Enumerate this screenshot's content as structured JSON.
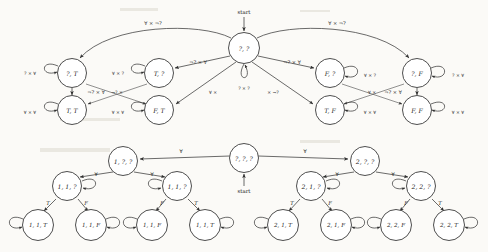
{
  "figure": {
    "kind": "two finite-state automata diagrams",
    "background_color": "#fbfaf7",
    "ink_color": "#3a3a3a"
  },
  "symbols": {
    "forall": "∀",
    "times": "×",
    "neg": "¬",
    "question": "?"
  },
  "top_automaton": {
    "name": "pair-state automaton",
    "start_label": "start",
    "start_state": "?, ?",
    "states": [
      {
        "id": "qq",
        "label": "?, ?",
        "cx": 244,
        "cy": 48,
        "r": 15.5
      },
      {
        "id": "qT",
        "label": "?, T",
        "cx": 72,
        "cy": 73,
        "r": 14.5
      },
      {
        "id": "Tq",
        "label": "T, ?",
        "cx": 159,
        "cy": 73,
        "r": 14.5
      },
      {
        "id": "Fq",
        "label": "F, ?",
        "cx": 330,
        "cy": 73,
        "r": 14.5
      },
      {
        "id": "qF",
        "label": "?, F",
        "cx": 417,
        "cy": 73,
        "r": 14.5
      },
      {
        "id": "TT",
        "label": "T, T",
        "cx": 72,
        "cy": 110,
        "r": 14.5
      },
      {
        "id": "FT",
        "label": "F, T",
        "cx": 159,
        "cy": 110,
        "r": 14.5
      },
      {
        "id": "TF",
        "label": "T, F",
        "cx": 330,
        "cy": 110,
        "r": 14.5
      },
      {
        "id": "FF",
        "label": "F, F",
        "cx": 417,
        "cy": 110,
        "r": 14.5
      }
    ],
    "self_loops": [
      {
        "state": "qq",
        "label": "? × ?",
        "x": 244,
        "y": 88,
        "side": "bottom"
      },
      {
        "state": "qT",
        "label": "? × ∀",
        "x": 36,
        "y": 73,
        "side": "left"
      },
      {
        "state": "Tq",
        "label": "∀ × ?",
        "x": 123,
        "y": 73,
        "side": "left"
      },
      {
        "state": "Fq",
        "label": "∀ × ?",
        "x": 366,
        "y": 75,
        "side": "right"
      },
      {
        "state": "qF",
        "label": "? × ∀",
        "x": 453,
        "y": 75,
        "side": "right"
      },
      {
        "state": "TT",
        "label": "∀ × ∀",
        "x": 36,
        "y": 112,
        "side": "left"
      },
      {
        "state": "FT",
        "label": "∀ × ∀",
        "x": 123,
        "y": 112,
        "side": "left"
      },
      {
        "state": "TF",
        "label": "∀ × ∀",
        "x": 366,
        "y": 112,
        "side": "right"
      },
      {
        "state": "FF",
        "label": "∀ × ∀",
        "x": 453,
        "y": 112,
        "side": "right"
      }
    ],
    "arc_labels": [
      {
        "label": "∀ × ¬?",
        "x": 153,
        "y": 23
      },
      {
        "label": "∀ × ¬?",
        "x": 337,
        "y": 23
      }
    ],
    "vertical_labels": [
      {
        "label": "¬? × ∀",
        "x": 96,
        "y": 92
      },
      {
        "label": "¬? × ∀",
        "x": 393,
        "y": 92
      }
    ],
    "diagonal_labels": [
      {
        "label": "¬? × ∀",
        "x": 198,
        "y": 62
      },
      {
        "label": "¬? × ∀",
        "x": 292,
        "y": 62
      },
      {
        "label": "∀ ×",
        "x": 213,
        "y": 92
      },
      {
        "label": "× ¬?",
        "x": 273,
        "y": 92
      },
      {
        "label": "¬? ×",
        "x": 117,
        "y": 92
      },
      {
        "label": "∀ ×",
        "x": 372,
        "y": 92
      }
    ]
  },
  "bottom_automaton": {
    "name": "triple-state tree automaton",
    "start_label": "start",
    "start_state": "?, ?, ?",
    "states": [
      {
        "id": "root",
        "label": "?, ?, ?",
        "cx": 244,
        "cy": 158,
        "r": 14.5
      },
      {
        "id": "n1",
        "label": "1, ?, ?",
        "cx": 123,
        "cy": 161,
        "r": 14.5
      },
      {
        "id": "n2",
        "label": "2, ?, ?",
        "cx": 365,
        "cy": 161,
        "r": 14.5
      },
      {
        "id": "n11",
        "label": "1, 1, ?",
        "cx": 67,
        "cy": 186,
        "r": 14.5
      },
      {
        "id": "n12",
        "label": "1, 1, ?",
        "cx": 177,
        "cy": 186,
        "r": 14.5
      },
      {
        "id": "n21",
        "label": "2, 1, ?",
        "cx": 311,
        "cy": 186,
        "r": 14.5
      },
      {
        "id": "n22",
        "label": "2, 2, ?",
        "cx": 421,
        "cy": 186,
        "r": 14.5
      },
      {
        "id": "l1",
        "label": "1, 1, T",
        "cx": 38,
        "cy": 225,
        "r": 15.5
      },
      {
        "id": "l2",
        "label": "1, 1, F",
        "cx": 91,
        "cy": 225,
        "r": 15.5
      },
      {
        "id": "l3",
        "label": "1, 1, F",
        "cx": 152,
        "cy": 225,
        "r": 15.5
      },
      {
        "id": "l4",
        "label": "1, 1, T",
        "cx": 205,
        "cy": 225,
        "r": 15.5
      },
      {
        "id": "l5",
        "label": "2, 1, T",
        "cx": 283,
        "cy": 225,
        "r": 15.5
      },
      {
        "id": "l6",
        "label": "2, 1, F",
        "cx": 336,
        "cy": 225,
        "r": 15.5
      },
      {
        "id": "l7",
        "label": "2, 2, F",
        "cx": 396,
        "cy": 225,
        "r": 15.5
      },
      {
        "id": "l8",
        "label": "2, 2, T",
        "cx": 449,
        "cy": 225,
        "r": 15.5
      }
    ],
    "branch_labels": [
      {
        "label": "∀",
        "x": 181,
        "y": 153
      },
      {
        "label": "∀",
        "x": 305,
        "y": 153
      },
      {
        "label": "∀",
        "x": 96,
        "y": 176
      },
      {
        "label": "∀",
        "x": 151,
        "y": 176
      },
      {
        "label": "∀",
        "x": 338,
        "y": 176
      },
      {
        "label": "∀",
        "x": 393,
        "y": 176
      },
      {
        "label": "T",
        "x": 50,
        "y": 203
      },
      {
        "label": "F",
        "x": 84,
        "y": 203
      },
      {
        "label": "F",
        "x": 160,
        "y": 203
      },
      {
        "label": "T",
        "x": 194,
        "y": 203
      },
      {
        "label": "T",
        "x": 294,
        "y": 203
      },
      {
        "label": "F",
        "x": 328,
        "y": 203
      },
      {
        "label": "F",
        "x": 404,
        "y": 203
      },
      {
        "label": "T",
        "x": 438,
        "y": 203
      }
    ],
    "leaf_loop_symbol": "∀"
  }
}
